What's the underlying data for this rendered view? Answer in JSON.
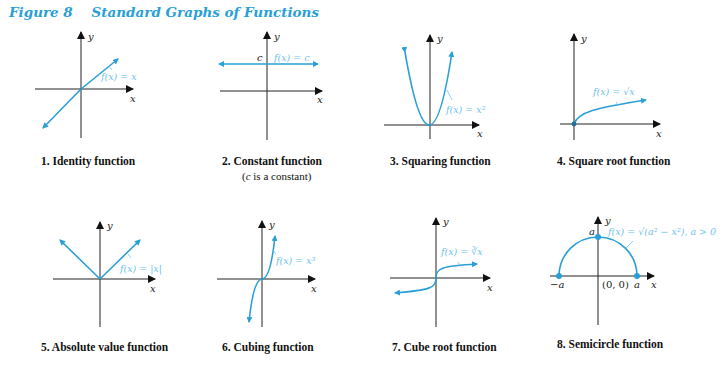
{
  "figure": {
    "title": "Figure 8    Standard Graphs of Functions",
    "accent_color": "#2a9fd6"
  },
  "axes": {
    "x_label": "x",
    "y_label": "y"
  },
  "graphs": [
    {
      "number": 1,
      "caption": "1.  Identity function",
      "label": "f(x) = x"
    },
    {
      "number": 2,
      "caption": "2.  Constant function",
      "subcaption_pre": "(",
      "subcaption_var": "c",
      "subcaption_post": " is a constant)",
      "label": "f(x) = c",
      "point_label": "c"
    },
    {
      "number": 3,
      "caption": "3.  Squaring function",
      "label": "f(x) = x²"
    },
    {
      "number": 4,
      "caption": "4.  Square root function",
      "label": "f(x) = √x"
    },
    {
      "number": 5,
      "caption": "5.  Absolute value function",
      "label": "f(x) = |x|"
    },
    {
      "number": 6,
      "caption": "6.  Cubing function",
      "label": "f(x) = x³"
    },
    {
      "number": 7,
      "caption": "7.  Cube root function",
      "label": "f(x) = ∛x"
    },
    {
      "number": 8,
      "caption": "8. Semicircle function",
      "label": "f(x) = √(a² − x²), a > 0",
      "point_labels": {
        "neg_a": "−a",
        "origin": "(0, 0)",
        "pos_a": "a",
        "top_a": "a"
      }
    }
  ]
}
